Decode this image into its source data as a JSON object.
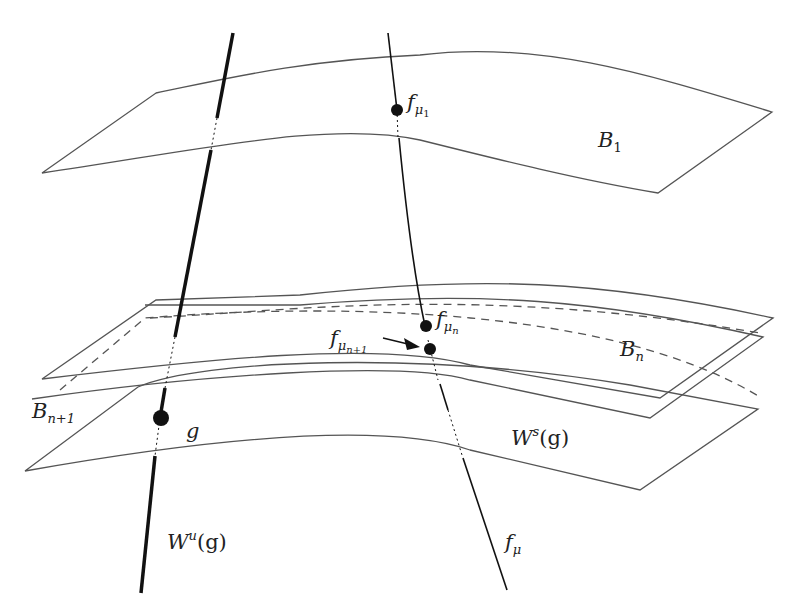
{
  "diagram": {
    "surfaces": [
      {
        "id": "B1",
        "label": "B",
        "subscript": "1"
      },
      {
        "id": "Bn",
        "label": "B",
        "subscript": "n"
      },
      {
        "id": "Bn1",
        "label": "B",
        "subscript": "n+1"
      },
      {
        "id": "Ws",
        "label": "W",
        "superscript": "s",
        "suffix": "(g)"
      }
    ],
    "curves": [
      {
        "id": "Wu",
        "label": "W",
        "superscript": "u",
        "suffix": "(g)"
      },
      {
        "id": "fmu",
        "label": "f",
        "subscript": "μ"
      }
    ],
    "points": [
      {
        "id": "fmu1",
        "label": "f",
        "subscript": "μ",
        "subsub": "1"
      },
      {
        "id": "fmun",
        "label": "f",
        "subscript": "μ",
        "subsub": "n"
      },
      {
        "id": "fmun1",
        "label": "f",
        "subscript": "μ",
        "subsub": "n+1"
      },
      {
        "id": "g",
        "label": "g"
      }
    ],
    "colors": {
      "line": "#444444",
      "ink": "#111111"
    }
  }
}
